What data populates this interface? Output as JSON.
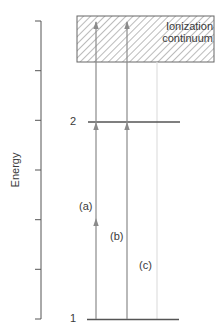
{
  "diagram": {
    "axis": {
      "label": "Energy",
      "tick_count": 7
    },
    "continuum": {
      "label_line1": "Ionization",
      "label_line2": "continuum",
      "fill": "hatched"
    },
    "levels": [
      {
        "id": "1",
        "label": "1"
      },
      {
        "id": "2",
        "label": "2"
      }
    ],
    "transitions": [
      {
        "id": "a",
        "label": "(a)",
        "from": "1",
        "to": "continuum",
        "arrowheads_at": [
          "midway",
          "level-2",
          "continuum"
        ]
      },
      {
        "id": "b",
        "label": "(b)",
        "from": "1",
        "to": "continuum",
        "arrowheads_at": [
          "level-2",
          "continuum"
        ]
      },
      {
        "id": "c",
        "label": "(c)",
        "from": "1",
        "to": "continuum",
        "style": "faint"
      }
    ],
    "colors": {
      "line": "#555555",
      "arrow": "#8a8a8a",
      "faint": "#e2e2e2",
      "hatch": "#8c8c8c"
    }
  }
}
